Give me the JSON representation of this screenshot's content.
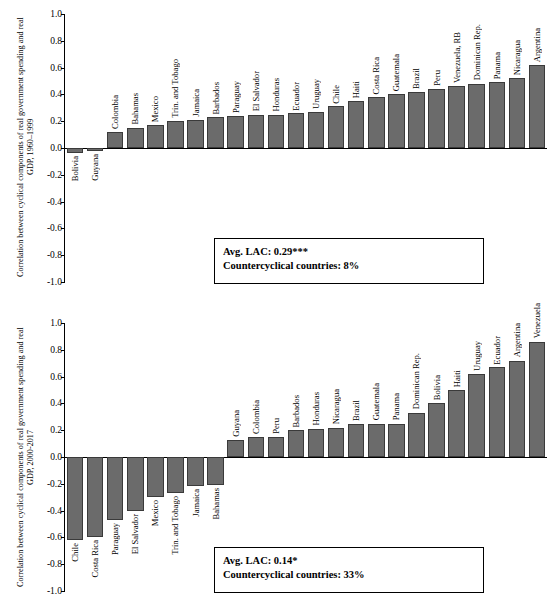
{
  "chart_data": [
    {
      "type": "bar",
      "title": "",
      "ylabel": "Correlation between cyclical components of real government spending and real GDP, 1960–1999",
      "xlabel": "",
      "ylim": [
        -1.0,
        1.0
      ],
      "yticks": [
        "1.0",
        "0.8",
        "0.6",
        "0.4",
        "0.2",
        "0.0",
        "-0.2",
        "-0.4",
        "-0.6",
        "-0.8",
        "-1.0"
      ],
      "grid": false,
      "categories": [
        "Bolivia",
        "Guyana",
        "Colombia",
        "Bahamas",
        "Mexico",
        "Trin. and Tobago",
        "Jamaica",
        "Barbados",
        "Paraguay",
        "El Salvador",
        "Honduras",
        "Ecuador",
        "Uruguay",
        "Chile",
        "Haiti",
        "Costa Rica",
        "Guatemala",
        "Brazil",
        "Peru",
        "Venezuela, RB",
        "Dominican Rep.",
        "Panama",
        "Nicaragua",
        "Argentina"
      ],
      "values": [
        -0.04,
        -0.02,
        0.12,
        0.15,
        0.17,
        0.2,
        0.21,
        0.23,
        0.24,
        0.25,
        0.25,
        0.26,
        0.27,
        0.31,
        0.35,
        0.38,
        0.4,
        0.42,
        0.44,
        0.46,
        0.48,
        0.49,
        0.52,
        0.62
      ],
      "annotation_line1": "Avg. LAC: 0.29***",
      "annotation_line2": "Countercyclical countries: 8%"
    },
    {
      "type": "bar",
      "title": "",
      "ylabel": "Correlation between cyclical components of real government spending and real GDP, 2000-2017",
      "xlabel": "",
      "ylim": [
        -1.0,
        1.0
      ],
      "yticks": [
        "1.0",
        "0.8",
        "0.6",
        "0.4",
        "0.2",
        "0.0",
        "-0.2",
        "-0.4",
        "-0.6",
        "-0.8",
        "-1.0"
      ],
      "grid": false,
      "categories": [
        "Chile",
        "Costa Rica",
        "Paraguay",
        "El Salvador",
        "Mexico",
        "Trin. and Tobago",
        "Jamaica",
        "Bahamas",
        "Guyana",
        "Colombia",
        "Peru",
        "Barbados",
        "Honduras",
        "Nicaragua",
        "Brazil",
        "Guatemala",
        "Panama",
        "Dominican Rep.",
        "Bolivia",
        "Haiti",
        "Uruguay",
        "Ecuador",
        "Argentina",
        "Venezuela"
      ],
      "values": [
        -0.62,
        -0.6,
        -0.47,
        -0.4,
        -0.3,
        -0.27,
        -0.22,
        -0.21,
        0.13,
        0.15,
        0.15,
        0.2,
        0.21,
        0.22,
        0.25,
        0.25,
        0.25,
        0.33,
        0.4,
        0.5,
        0.62,
        0.67,
        0.72,
        0.86
      ],
      "annotation_line1": "Avg. LAC: 0.14*",
      "annotation_line2": "Countercyclical countries: 33%"
    }
  ]
}
